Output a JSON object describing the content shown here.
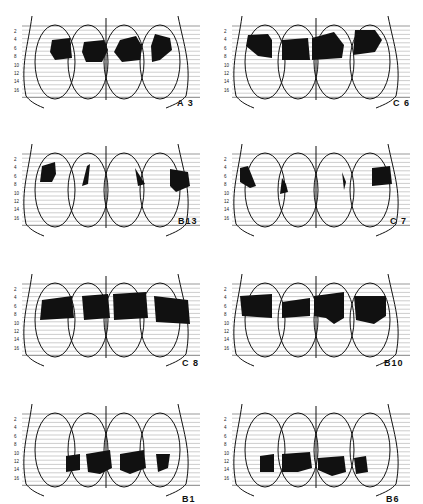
{
  "figure": {
    "y_ticks": [
      "2",
      "4",
      "6",
      "8",
      "10",
      "12",
      "14",
      "16"
    ],
    "panels": [
      {
        "id": "A3",
        "label": "A 3",
        "lesion_level": "anterior (lines 4-10)"
      },
      {
        "id": "C6",
        "label": "C 6",
        "lesion_level": "anterior (lines 4-9)"
      },
      {
        "id": "B13",
        "label": "B13",
        "lesion_level": "lateral (lines 4-11)"
      },
      {
        "id": "C7",
        "label": "C 7",
        "lesion_level": "lateral (lines 5-10)"
      },
      {
        "id": "C8",
        "label": "C 8",
        "lesion_level": "mid band (lines 5-10)"
      },
      {
        "id": "B10",
        "label": "B10",
        "lesion_level": "mid band (lines 5-11)"
      },
      {
        "id": "B1",
        "label": "B1",
        "lesion_level": "posterior (lines 11-16)"
      },
      {
        "id": "B6",
        "label": "B6",
        "lesion_level": "posterior (lines 11-16)"
      }
    ]
  },
  "colors": {
    "ink": "#111111",
    "lines": "#9a9a9a",
    "paper": "#ffffff"
  }
}
